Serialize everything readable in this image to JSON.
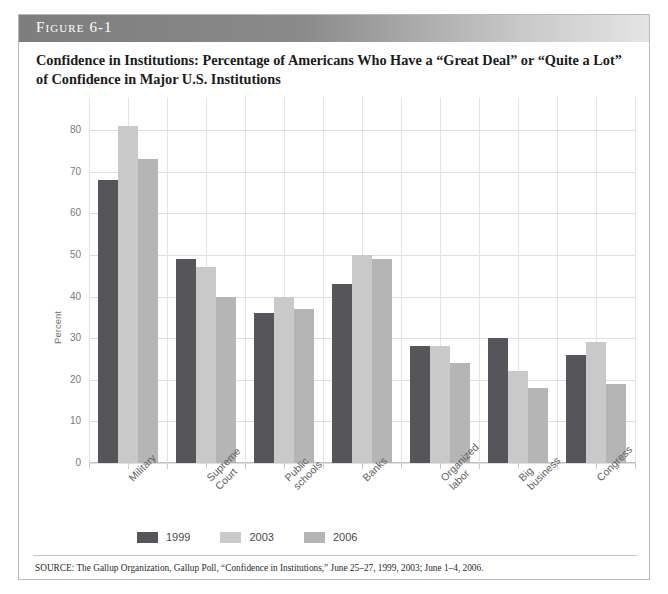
{
  "figure": {
    "banner_label": "Figure 6-1",
    "title": "Confidence in Institutions: Percentage of Americans Who Have a “Great Deal” or “Quite a Lot” of Confidence in Major U.S. Institutions",
    "source_note": "SOURCE: The Gallup Organization, Gallup Poll, “Confidence in Institutions,” June 25–27, 1999, 2003; June 1–4, 2006."
  },
  "colors": {
    "series_1999": "#55555a",
    "series_2003": "#c9c9c9",
    "series_2006": "#b5b5b5",
    "banner_dark": "#7d7d7d",
    "banner_light": "#e4e4e4",
    "gridline": "#dfdfdf",
    "axis": "#c2c2c2",
    "frame": "#b9b9b9"
  },
  "chart_data": {
    "type": "bar",
    "title": "Confidence in Institutions: Percentage of Americans Who Have a “Great Deal” or “Quite a Lot” of Confidence in Major U.S. Institutions",
    "xlabel": "",
    "ylabel": "Percent",
    "ylim": [
      0,
      80
    ],
    "yticks": [
      0,
      10,
      20,
      30,
      40,
      50,
      60,
      70,
      80
    ],
    "grid": true,
    "legend_position": "bottom",
    "categories": [
      "Military",
      "Supreme Court",
      "Public schools",
      "Banks",
      "Organized labor",
      "Big business",
      "Congress"
    ],
    "series": [
      {
        "name": "1999",
        "color": "#55555a",
        "values": [
          68,
          49,
          36,
          43,
          28,
          30,
          26
        ]
      },
      {
        "name": "2003",
        "color": "#c9c9c9",
        "values": [
          81,
          47,
          40,
          50,
          28,
          22,
          29
        ]
      },
      {
        "name": "2006",
        "color": "#b5b5b5",
        "values": [
          73,
          40,
          37,
          49,
          24,
          18,
          19
        ]
      }
    ]
  },
  "legend": {
    "entries": [
      {
        "label": "1999",
        "color": "#55555a"
      },
      {
        "label": "2003",
        "color": "#c9c9c9"
      },
      {
        "label": "2006",
        "color": "#b5b5b5"
      }
    ]
  }
}
